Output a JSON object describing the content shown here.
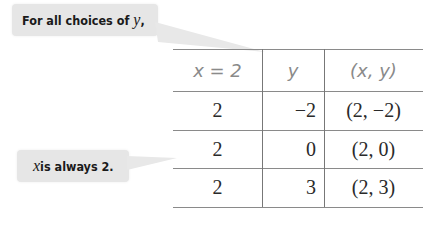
{
  "callouts": {
    "top": {
      "prefix": "For all choices of ",
      "var": "y",
      "suffix": ","
    },
    "bottom": {
      "var": "x",
      "suffix": " is always 2."
    }
  },
  "table": {
    "headers": [
      "x = 2",
      "y",
      "(x, y)"
    ],
    "rows": [
      [
        "2",
        "−2",
        "(2, −2)"
      ],
      [
        "2",
        "0",
        "(2, 0)"
      ],
      [
        "2",
        "3",
        "(2, 3)"
      ]
    ]
  }
}
